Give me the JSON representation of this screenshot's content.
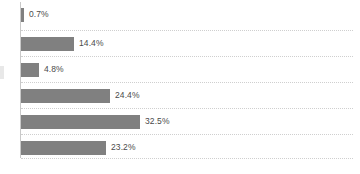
{
  "chart_data": {
    "type": "bar",
    "orientation": "horizontal",
    "title": "",
    "subtitle": "",
    "xlabel": "",
    "ylabel": "",
    "categories": [
      "",
      "",
      "",
      "",
      "",
      ""
    ],
    "values": [
      0.7,
      14.4,
      4.8,
      24.4,
      32.5,
      23.2
    ],
    "data_labels": [
      "0.7%",
      "14.4%",
      "4.8%",
      "24.4%",
      "32.5%",
      "23.2%"
    ],
    "xlim": [
      0,
      90
    ],
    "grid": "horizontal-dotted",
    "legend": "none",
    "series": [
      {
        "name": "",
        "values": [
          0.7,
          14.4,
          4.8,
          24.4,
          32.5,
          23.2
        ]
      }
    ],
    "colors": {
      "bar": "#808080",
      "gridline": "#cfcfcf",
      "axis": "#c9c9c9",
      "label_text": "#4a4a4a",
      "background": "#ffffff"
    }
  },
  "bars": [
    {
      "label": "0.7%",
      "value": 0.7,
      "width_px": 3,
      "top_px": 4,
      "label_left_px": 8
    },
    {
      "label": "14.4%",
      "value": 14.4,
      "width_px": 53,
      "top_px": 33,
      "label_left_px": 58
    },
    {
      "label": "4.8%",
      "value": 4.8,
      "width_px": 18,
      "top_px": 59,
      "label_left_px": 23
    },
    {
      "label": "24.4%",
      "value": 24.4,
      "width_px": 89,
      "top_px": 85,
      "label_left_px": 94
    },
    {
      "label": "32.5%",
      "value": 32.5,
      "width_px": 119,
      "top_px": 111,
      "label_left_px": 124
    },
    {
      "label": "23.2%",
      "value": 23.2,
      "width_px": 85,
      "top_px": 137,
      "label_left_px": 90
    }
  ],
  "gridlines": [
    {
      "top_px": 26
    },
    {
      "top_px": 52
    },
    {
      "top_px": 78
    },
    {
      "top_px": 104
    },
    {
      "top_px": 130
    },
    {
      "top_px": 154
    }
  ]
}
